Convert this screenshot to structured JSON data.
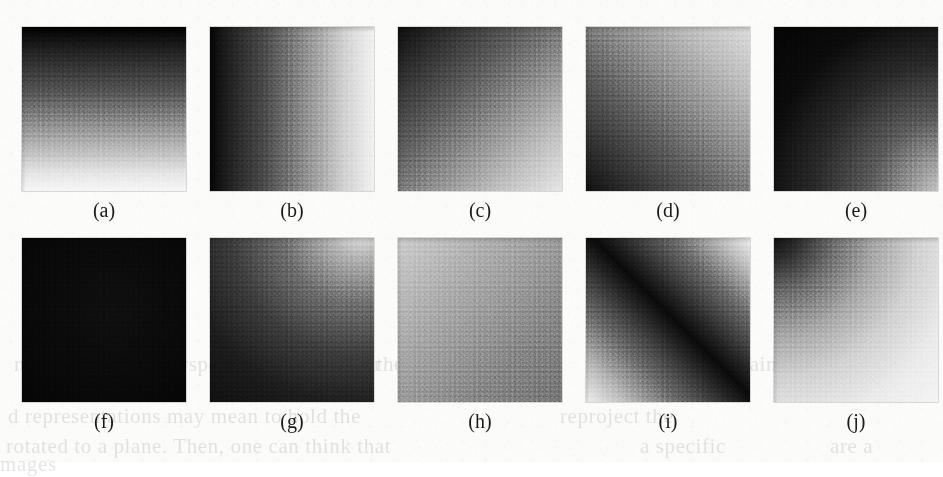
{
  "figure": {
    "kind": "grayscale-intensity-patch-array",
    "rows": 2,
    "columns": 5,
    "panel_count": 10
  },
  "panels": [
    {
      "id": "a",
      "caption": "(a)",
      "gradient_class": "g-a",
      "pattern": "vertical ramp",
      "dark_at": "top",
      "light_at": "bottom",
      "min_gray": 0,
      "max_gray": 246
    },
    {
      "id": "b",
      "caption": "(b)",
      "gradient_class": "g-b",
      "pattern": "horizontal ramp",
      "dark_at": "left",
      "light_at": "right",
      "min_gray": 5,
      "max_gray": 242
    },
    {
      "id": "c",
      "caption": "(c)",
      "gradient_class": "g-c",
      "pattern": "diagonal ramp",
      "dark_at": "top-left",
      "light_at": "bottom-right",
      "min_gray": 13,
      "max_gray": 230
    },
    {
      "id": "d",
      "caption": "(d)",
      "gradient_class": "g-d",
      "pattern": "diagonal ramp",
      "dark_at": "bottom-left",
      "light_at": "top-right",
      "min_gray": 16,
      "max_gray": 220
    },
    {
      "id": "e",
      "caption": "(e)",
      "gradient_class": "g-e",
      "pattern": "corner radial",
      "dark_at": "top-left",
      "light_at": "bottom-right",
      "min_gray": 4,
      "max_gray": 216
    },
    {
      "id": "f",
      "caption": "(f)",
      "gradient_class": "g-f",
      "pattern": "uniform",
      "dark_at": "whole patch",
      "light_at": "none",
      "min_gray": 5,
      "max_gray": 15
    },
    {
      "id": "g",
      "caption": "(g)",
      "gradient_class": "g-g",
      "pattern": "corner radial",
      "dark_at": "bottom-left",
      "light_at": "top-right",
      "min_gray": 16,
      "max_gray": 240
    },
    {
      "id": "h",
      "caption": "(h)",
      "gradient_class": "g-h",
      "pattern": "shallow diagonal ramp",
      "dark_at": "bottom-right",
      "light_at": "top-left",
      "min_gray": 116,
      "max_gray": 205
    },
    {
      "id": "i",
      "caption": "(i)",
      "gradient_class": "g-i",
      "pattern": "diagonal dark band",
      "dark_at": "top-left to bottom-right band",
      "light_at": "top-right and bottom-left corners",
      "min_gray": 10,
      "max_gray": 239
    },
    {
      "id": "j",
      "caption": "(j)",
      "gradient_class": "g-j",
      "pattern": "corner radial",
      "dark_at": "top-left",
      "light_at": "bottom-right",
      "min_gray": 7,
      "max_gray": 244
    }
  ],
  "show_through_text": [
    {
      "text": "may to hold the perspective. The number",
      "x": 14,
      "y": 352
    },
    {
      "text": "of the values of the",
      "x": 352,
      "y": 352
    },
    {
      "text": "a certain",
      "x": 700,
      "y": 352
    },
    {
      "text": "d representations may mean to hold the",
      "x": 8,
      "y": 404
    },
    {
      "text": "reproject the",
      "x": 560,
      "y": 404
    },
    {
      "text": "rotated to a plane. Then, one can think that",
      "x": 6,
      "y": 434
    },
    {
      "text": "a specific",
      "x": 640,
      "y": 434
    },
    {
      "text": "are a",
      "x": 830,
      "y": 434
    },
    {
      "text": "mages",
      "x": 0,
      "y": 452
    }
  ],
  "colors": {
    "paper": "#fbfbf9",
    "caption_text": "#1b1b1b",
    "show_through_text": "#6f6f6a"
  }
}
